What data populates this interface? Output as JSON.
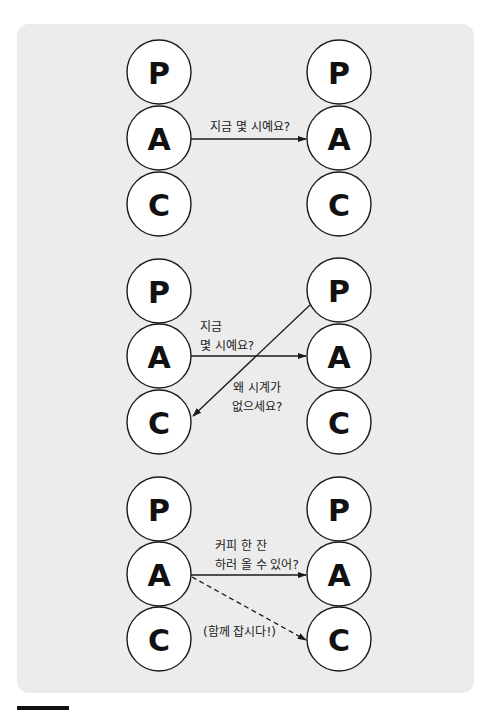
{
  "colors": {
    "background": "#ffffff",
    "panel": "#ececec",
    "stroke": "#1a1a1a",
    "circle_fill": "#ffffff",
    "footer_bar": "#111111"
  },
  "node_letters": [
    "P",
    "A",
    "C"
  ],
  "diagrams": [
    {
      "id": "group-1",
      "left_nodes": [
        "P",
        "A",
        "C"
      ],
      "right_nodes": [
        "P",
        "A",
        "C"
      ],
      "edges": [
        {
          "from": "left.A",
          "to": "right.A",
          "style": "solid",
          "label": [
            "지금 몇 시예요?"
          ]
        }
      ]
    },
    {
      "id": "group-2",
      "left_nodes": [
        "P",
        "A",
        "C"
      ],
      "right_nodes": [
        "P",
        "A",
        "C"
      ],
      "edges": [
        {
          "from": "left.A",
          "to": "right.A",
          "style": "solid",
          "label": [
            "지금",
            "몇 시예요?"
          ]
        },
        {
          "from": "right.P",
          "to": "left.C",
          "style": "solid",
          "label": [
            "왜 시계가",
            "없으세요?"
          ]
        }
      ]
    },
    {
      "id": "group-3",
      "left_nodes": [
        "P",
        "A",
        "C"
      ],
      "right_nodes": [
        "P",
        "A",
        "C"
      ],
      "edges": [
        {
          "from": "left.A",
          "to": "right.A",
          "style": "solid",
          "label": [
            "커피 한 잔",
            "하러 올 수 있어?"
          ]
        },
        {
          "from": "left.A",
          "to": "right.C",
          "style": "dashed",
          "label": [
            "(함께 잡시다!)"
          ]
        }
      ]
    }
  ]
}
